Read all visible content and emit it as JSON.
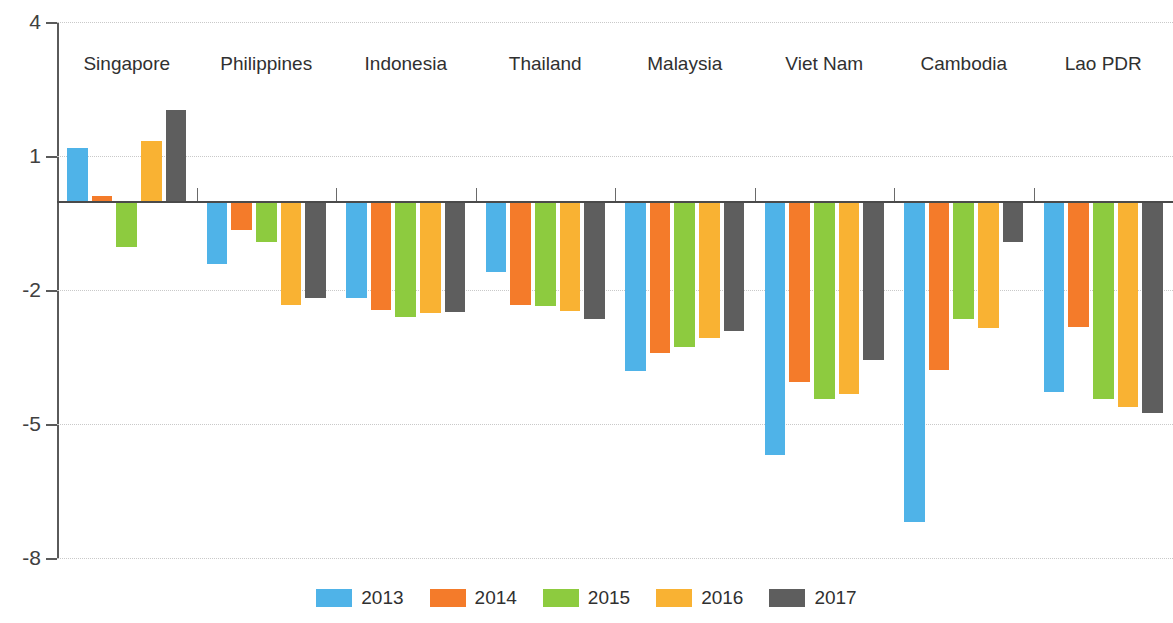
{
  "chart_data": {
    "type": "bar",
    "title": "",
    "subtitle": "",
    "xlabel": "",
    "ylabel": "",
    "ylim": [
      -8,
      4
    ],
    "yticks": [
      4,
      1,
      -2,
      -5,
      -8
    ],
    "ytick_labels": [
      "4",
      "1",
      "-2",
      "-5",
      "-8"
    ],
    "grid": true,
    "legend_position": "bottom",
    "categories": [
      "Singapore",
      "Philippines",
      "Indonesia",
      "Thailand",
      "Malaysia",
      "Viet Nam",
      "Cambodia",
      "Lao PDR"
    ],
    "series": [
      {
        "name": "2013",
        "color": "#4FB3E8",
        "values": [
          1.18,
          -1.41,
          -2.17,
          -1.59,
          -3.81,
          -5.69,
          -7.2,
          -4.28
        ]
      },
      {
        "name": "2014",
        "color": "#F47B2A",
        "values": [
          0.1,
          -0.65,
          -2.44,
          -2.33,
          -3.4,
          -4.05,
          -3.8,
          -2.82
        ]
      },
      {
        "name": "2015",
        "color": "#8DCB3F",
        "values": [
          -1.03,
          -0.92,
          -2.6,
          -2.36,
          -3.27,
          -4.43,
          -2.66,
          -4.45
        ]
      },
      {
        "name": "2016",
        "color": "#F9B233",
        "values": [
          1.34,
          -2.33,
          -2.51,
          -2.46,
          -3.07,
          -4.32,
          -2.86,
          -4.61
        ]
      },
      {
        "name": "2017",
        "color": "#5E5E5E",
        "values": [
          2.03,
          -2.17,
          -2.49,
          -2.64,
          -2.91,
          -3.56,
          -0.92,
          -4.75
        ]
      }
    ]
  },
  "legend": {
    "items": [
      {
        "label": "2013",
        "color": "#4FB3E8"
      },
      {
        "label": "2014",
        "color": "#F47B2A"
      },
      {
        "label": "2015",
        "color": "#8DCB3F"
      },
      {
        "label": "2016",
        "color": "#F9B233"
      },
      {
        "label": "2017",
        "color": "#5E5E5E"
      }
    ]
  },
  "axis": {
    "y_tick_labels": [
      "4",
      "1",
      "-2",
      "-5",
      "-8"
    ]
  }
}
